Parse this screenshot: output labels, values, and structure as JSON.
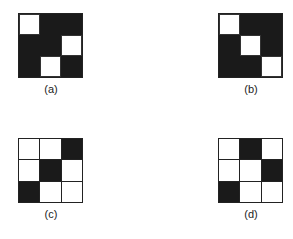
{
  "figure": {
    "panels": [
      {
        "id": "a",
        "label": "(a)",
        "style": "solid",
        "cells": [
          [
            "white",
            "black",
            "black"
          ],
          [
            "black",
            "black",
            "white"
          ],
          [
            "black",
            "white",
            "black"
          ]
        ]
      },
      {
        "id": "b",
        "label": "(b)",
        "style": "solid",
        "cells": [
          [
            "white",
            "black",
            "black"
          ],
          [
            "black",
            "white",
            "black"
          ],
          [
            "black",
            "black",
            "white"
          ]
        ]
      },
      {
        "id": "c",
        "label": "(c)",
        "style": "lines",
        "cells": [
          [
            "white",
            "white",
            "black"
          ],
          [
            "white",
            "black",
            "white"
          ],
          [
            "black",
            "white",
            "white"
          ]
        ]
      },
      {
        "id": "d",
        "label": "(d)",
        "style": "lines",
        "cells": [
          [
            "white",
            "black",
            "white"
          ],
          [
            "white",
            "white",
            "black"
          ],
          [
            "black",
            "white",
            "white"
          ]
        ]
      }
    ]
  },
  "colors": {
    "dark": "#1a1a1a",
    "light": "#ffffff"
  }
}
